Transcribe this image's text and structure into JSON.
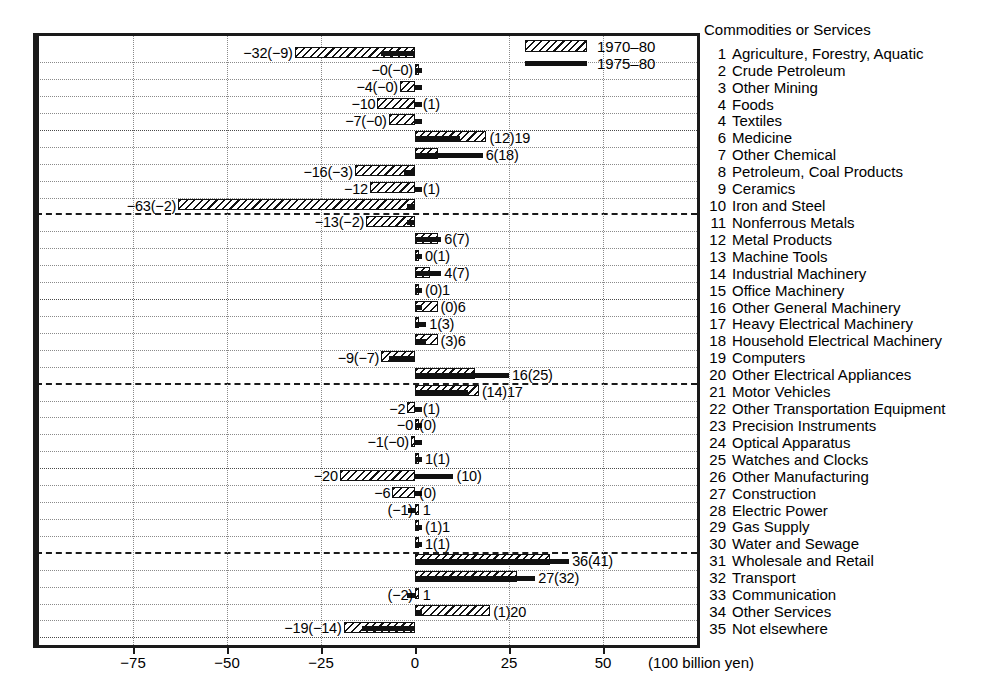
{
  "chart_data": {
    "type": "bar",
    "orientation": "horizontal",
    "title": "",
    "xlabel": "(100 billion yen)",
    "ylabel": "Commodities or Services",
    "xlim": [
      -85,
      76
    ],
    "xticks": [
      -75,
      -50,
      -25,
      0,
      25,
      50
    ],
    "xticklabels": [
      "−75",
      "−50",
      "−25",
      "0",
      "25",
      "50"
    ],
    "grid": true,
    "legend_position": "top-right",
    "series": [
      {
        "name": "1970–80",
        "style": "hatched-bar"
      },
      {
        "name": "1975–80",
        "style": "thick-black-bar"
      }
    ],
    "categories": [
      "Agriculture, Forestry, Aquatic",
      "Crude Petroleum",
      "Other Mining",
      "Foods",
      "Textiles",
      "Medicine",
      "Other Chemical",
      "Petroleum, Coal Products",
      "Ceramics",
      "Iron and Steel",
      "Nonferrous Metals",
      "Metal Products",
      "Machine Tools",
      "Industrial Machinery",
      "Office Machinery",
      "Other General Machinery",
      "Heavy Electrical Machinery",
      "Household Electrical Machinery",
      "Computers",
      "Other Electrical Appliances",
      "Motor Vehicles",
      "Other Transportation Equipment",
      "Precision Instruments",
      "Optical Apparatus",
      "Watches and Clocks",
      "Other Manufacturing",
      "Construction",
      "Electric Power",
      "Gas Supply",
      "Water and Sewage",
      "Wholesale and Retail",
      "Transport",
      "Communication",
      "Other Services",
      "Not elsewhere"
    ],
    "rows": [
      {
        "n": "1",
        "name": "Agriculture, Forestry, Aquatic",
        "v70": -32,
        "v75": -9,
        "label": "−32(−9)",
        "side": "L"
      },
      {
        "n": "2",
        "name": "Crude Petroleum",
        "v70": 0,
        "v75": 0,
        "label": "−0(−0)",
        "side": "L"
      },
      {
        "n": "3",
        "name": "Other Mining",
        "v70": -4,
        "v75": 0,
        "label": "−4(−0)",
        "side": "L"
      },
      {
        "n": "4",
        "name": "Foods",
        "v70": -10,
        "v75": 1,
        "label": "−10",
        "side": "L",
        "label_r": "(1)"
      },
      {
        "n": "4",
        "name": "Textiles",
        "v70": -7,
        "v75": 0,
        "label": "−7(−0)",
        "side": "L"
      },
      {
        "n": "6",
        "name": "Medicine",
        "v70": 19,
        "v75": 12,
        "label": "(12)19",
        "side": "R"
      },
      {
        "n": "7",
        "name": "Other Chemical",
        "v70": 6,
        "v75": 18,
        "label": "6(18)",
        "side": "R"
      },
      {
        "n": "8",
        "name": "Petroleum, Coal Products",
        "v70": -16,
        "v75": -3,
        "label": "−16(−3)",
        "side": "L"
      },
      {
        "n": "9",
        "name": "Ceramics",
        "v70": -12,
        "v75": 1,
        "label": "−12",
        "side": "L",
        "label_r": "(1)"
      },
      {
        "n": "10",
        "name": "Iron and Steel",
        "v70": -63,
        "v75": -2,
        "label": "−63(−2)",
        "side": "L"
      },
      {
        "n": "11",
        "name": "Nonferrous Metals",
        "v70": -13,
        "v75": -2,
        "label": "−13(−2)",
        "side": "L"
      },
      {
        "n": "12",
        "name": "Metal Products",
        "v70": 6,
        "v75": 7,
        "label": "6(7)",
        "side": "R"
      },
      {
        "n": "13",
        "name": "Machine Tools",
        "v70": 0,
        "v75": 1,
        "label": "0(1)",
        "side": "R"
      },
      {
        "n": "14",
        "name": "Industrial Machinery",
        "v70": 4,
        "v75": 7,
        "label": "4(7)",
        "side": "R"
      },
      {
        "n": "15",
        "name": "Office Machinery",
        "v70": 1,
        "v75": 0,
        "label": "(0)1",
        "side": "R"
      },
      {
        "n": "16",
        "name": "Other General Machinery",
        "v70": 6,
        "v75": 0,
        "label": "(0)6",
        "side": "R"
      },
      {
        "n": "17",
        "name": "Heavy Electrical Machinery",
        "v70": 1,
        "v75": 3,
        "label": "1(3)",
        "side": "R"
      },
      {
        "n": "18",
        "name": "Household Electrical Machinery",
        "v70": 6,
        "v75": 3,
        "label": "(3)6",
        "side": "R"
      },
      {
        "n": "19",
        "name": "Computers",
        "v70": -9,
        "v75": -7,
        "label": "−9(−7)",
        "side": "L"
      },
      {
        "n": "20",
        "name": "Other Electrical Appliances",
        "v70": 16,
        "v75": 25,
        "label": "16(25)",
        "side": "R"
      },
      {
        "n": "21",
        "name": "Motor Vehicles",
        "v70": 17,
        "v75": 14,
        "label": "(14)17",
        "side": "R"
      },
      {
        "n": "22",
        "name": "Other Transportation Equipment",
        "v70": -2,
        "v75": 1,
        "label": "−2",
        "side": "L",
        "label_r": "(1)"
      },
      {
        "n": "23",
        "name": "Precision Instruments",
        "v70": 0,
        "v75": 0,
        "label": "−0",
        "side": "L",
        "label_r": "(0)"
      },
      {
        "n": "24",
        "name": "Optical Apparatus",
        "v70": -1,
        "v75": 0,
        "label": "−1(−0)",
        "side": "L"
      },
      {
        "n": "25",
        "name": "Watches and Clocks",
        "v70": 1,
        "v75": 1,
        "label": "1(1)",
        "side": "R"
      },
      {
        "n": "26",
        "name": "Other Manufacturing",
        "v70": -20,
        "v75": 10,
        "label": "−20",
        "side": "L",
        "label_r": "(10)"
      },
      {
        "n": "27",
        "name": "Construction",
        "v70": -6,
        "v75": 0,
        "label": "−6",
        "side": "L",
        "label_r": "(0)"
      },
      {
        "n": "28",
        "name": "Electric Power",
        "v70": 1,
        "v75": -1,
        "label": "(−1)",
        "side": "L",
        "label_r": "1"
      },
      {
        "n": "29",
        "name": "Gas Supply",
        "v70": 1,
        "v75": 1,
        "label": "(1)1",
        "side": "R"
      },
      {
        "n": "30",
        "name": "Water and Sewage",
        "v70": 1,
        "v75": 1,
        "label": "1(1)",
        "side": "R"
      },
      {
        "n": "31",
        "name": "Wholesale and Retail",
        "v70": 36,
        "v75": 41,
        "label": "36(41)",
        "side": "R"
      },
      {
        "n": "32",
        "name": "Transport",
        "v70": 27,
        "v75": 32,
        "label": "27(32)",
        "side": "R"
      },
      {
        "n": "33",
        "name": "Communication",
        "v70": 1,
        "v75": -2,
        "label": "(−2)",
        "side": "L",
        "label_r": "1"
      },
      {
        "n": "34",
        "name": "Other Services",
        "v70": 20,
        "v75": 1,
        "label": "(1)20",
        "side": "R"
      },
      {
        "n": "35",
        "name": "Not elsewhere",
        "v70": -19,
        "v75": -14,
        "label": "−19(−14)",
        "side": "L"
      }
    ]
  },
  "legend": {
    "entries": [
      {
        "label": "1970–80",
        "swatch": "hatched-bar"
      },
      {
        "label": "1975–80",
        "swatch": "thick-black-bar"
      }
    ]
  },
  "axis": {
    "units_note": "(100 billion yen)",
    "tick_labels": [
      "−75",
      "−50",
      "−25",
      "0",
      "25",
      "50"
    ]
  },
  "category_panel": {
    "header": "Commodities or Services"
  }
}
